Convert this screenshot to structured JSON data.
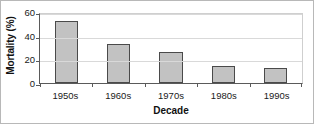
{
  "chart_data": {
    "type": "bar",
    "title": "",
    "subtitle": "",
    "categories": [
      "1950s",
      "1960s",
      "1970s",
      "1980s",
      "1990s"
    ],
    "values": [
      52,
      33,
      26,
      14,
      13
    ],
    "xlabel": "Decade",
    "ylabel": "Mortality (%)",
    "ylim": [
      0,
      60
    ],
    "yticks": [
      0,
      20,
      40,
      60
    ],
    "ytick_labels": [
      "0",
      "20",
      "40",
      "60"
    ],
    "grid": true,
    "grid_axis": "y",
    "legend": false,
    "legend_position": "none",
    "annotations": [],
    "series": [
      {
        "name": "Mortality",
        "values": [
          52,
          33,
          26,
          14,
          13
        ]
      }
    ],
    "colors": {
      "bar_fill": "#c2c2c2",
      "bar_edge": "#4a4a4a",
      "axis": "#5a5a5a",
      "gridline": "#d9d9d9",
      "text": "#1a1a1a",
      "frame": "#b8b8b8",
      "background": "#ffffff"
    }
  }
}
